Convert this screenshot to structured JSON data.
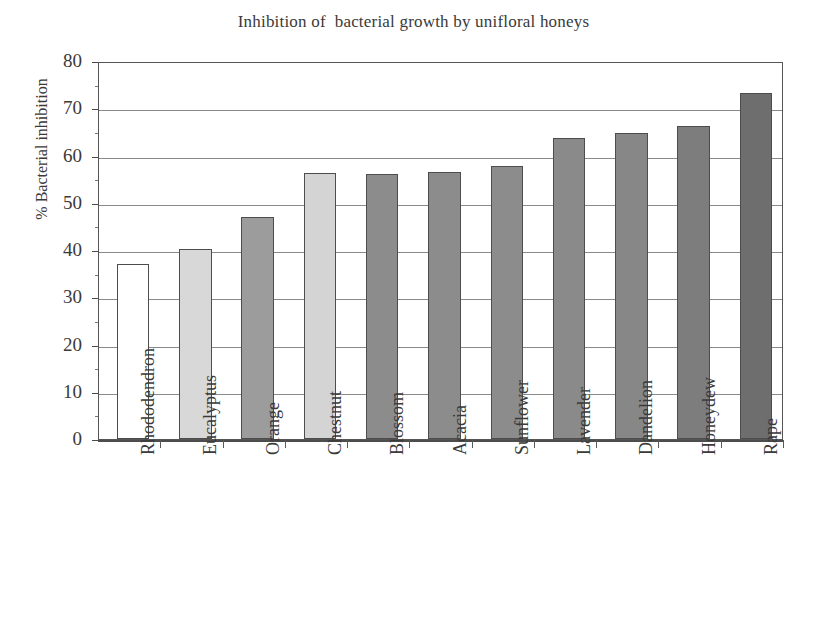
{
  "chart_data": {
    "type": "bar",
    "title": "Inhibition of  bacterial growth by unifloral honeys",
    "xlabel": "",
    "ylabel": "% Bacterial inhibition",
    "ylim": [
      0,
      80
    ],
    "ytick_step": 10,
    "grid": true,
    "legend": "none",
    "categories": [
      "Rhododendron",
      "Eucalyptus",
      "Orange",
      "Chestnut",
      "Blossom",
      "Acacia",
      "Sunflower",
      "Lavender",
      "Dandelion",
      "Honeydew",
      "Rape"
    ],
    "values": [
      37.0,
      40.3,
      47.0,
      56.2,
      56.1,
      56.5,
      57.8,
      63.7,
      64.8,
      66.3,
      73.3
    ],
    "ytick_labels": [
      "0",
      "10",
      "20",
      "30",
      "40",
      "50",
      "60",
      "70",
      "80"
    ],
    "bar_colors": [
      "#ffffff",
      "#d8d8d8",
      "#9c9c9c",
      "#d4d4d4",
      "#8c8c8c",
      "#8c8c8c",
      "#8c8c8c",
      "#8a8a8a",
      "#878787",
      "#7d7d7d",
      "#6e6e6e"
    ],
    "bar_edge_color": "#4d4d4d",
    "axis_color": "#555555",
    "grid_color": "#8a8a8a",
    "text_color": "#3a3a3a"
  }
}
